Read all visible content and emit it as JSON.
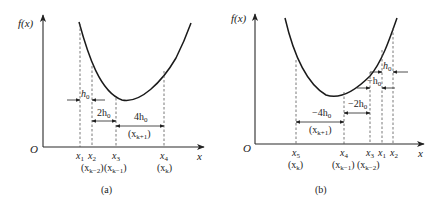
{
  "figure": {
    "panels": [
      {
        "id": "a",
        "caption": "(a)",
        "y_axis_label": "f(x)",
        "x_axis_label": "x",
        "origin_label": "O",
        "points": [
          {
            "name": "x",
            "sub": "1",
            "alias": ""
          },
          {
            "name": "x",
            "sub": "2",
            "alias": "(x",
            "alias_sub": "k−2",
            "alias_close": ")"
          },
          {
            "name": "x",
            "sub": "3",
            "alias": "(x",
            "alias_sub": "k−1",
            "alias_close": ")"
          },
          {
            "name": "x",
            "sub": "4",
            "alias": "(x",
            "alias_sub": "k",
            "alias_close": ")"
          }
        ],
        "steps": [
          {
            "label": "h",
            "label_sub": "0"
          },
          {
            "label": "2h",
            "label_sub": "0"
          },
          {
            "label": "4h",
            "label_sub": "0",
            "note": "(x",
            "note_sub": "k+1",
            "note_close": ")"
          }
        ]
      },
      {
        "id": "b",
        "caption": "(b)",
        "y_axis_label": "f(x)",
        "x_axis_label": "x",
        "origin_label": "O",
        "points": [
          {
            "name": "x",
            "sub": "5",
            "alias": "(x",
            "alias_sub": "k",
            "alias_close": ")"
          },
          {
            "name": "x",
            "sub": "4",
            "alias": "(x",
            "alias_sub": "k−1",
            "alias_close": ")"
          },
          {
            "name": "x",
            "sub": "3",
            "alias": "(x",
            "alias_sub": "k−2",
            "alias_close": ")"
          },
          {
            "name": "x",
            "sub": "1",
            "alias": ""
          },
          {
            "name": "x",
            "sub": "2",
            "alias": ""
          }
        ],
        "steps": [
          {
            "label": "h",
            "label_sub": "0"
          },
          {
            "label": "−h",
            "label_sub": "0"
          },
          {
            "label": "−2h",
            "label_sub": "0"
          },
          {
            "label": "−4h",
            "label_sub": "0",
            "note": "(x",
            "note_sub": "k+1",
            "note_close": ")"
          }
        ]
      }
    ]
  }
}
